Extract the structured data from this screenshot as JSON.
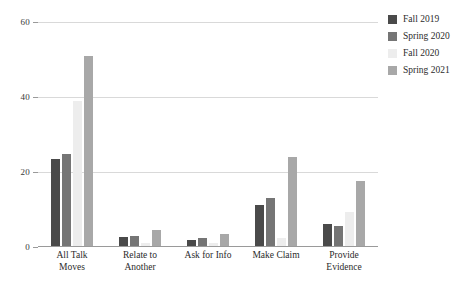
{
  "chart_data": {
    "type": "bar",
    "title": "",
    "subtitle": "",
    "xlabel": "",
    "ylabel": "",
    "ylim": [
      0,
      60
    ],
    "yticks": [
      0,
      20,
      40,
      60
    ],
    "grid": true,
    "legend_position": "right",
    "categories": [
      "All Talk Moves",
      "Relate to Another",
      "Ask for Info",
      "Make Claim",
      "Provide Evidence"
    ],
    "category_lines": [
      [
        "All Talk",
        "Moves"
      ],
      [
        "Relate to",
        "Another"
      ],
      [
        "Ask for Info",
        ""
      ],
      [
        "Make Claim",
        ""
      ],
      [
        "Provide",
        "Evidence"
      ]
    ],
    "series": [
      {
        "name": "Fall 2019",
        "color": "#4a4a4a",
        "values": [
          23.5,
          2.7,
          2.0,
          11.2,
          6.2
        ]
      },
      {
        "name": "Spring 2020",
        "color": "#757575",
        "values": [
          24.8,
          3.0,
          2.3,
          13.0,
          5.5
        ]
      },
      {
        "name": "Fall 2020",
        "color": "#ededed",
        "values": [
          39.0,
          1.0,
          1.0,
          2.5,
          9.3
        ]
      },
      {
        "name": "Spring 2021",
        "color": "#a8a8a8",
        "values": [
          51.0,
          4.5,
          3.5,
          24.0,
          17.7
        ]
      }
    ]
  },
  "axis": {
    "tick_labels": [
      "60",
      "40",
      "20",
      "0"
    ]
  },
  "legend": {
    "items": [
      {
        "label": "Fall 2019",
        "color": "#4a4a4a"
      },
      {
        "label": "Spring 2020",
        "color": "#757575"
      },
      {
        "label": "Fall 2020",
        "color": "#ededed"
      },
      {
        "label": "Spring 2021",
        "color": "#a8a8a8"
      }
    ]
  },
  "colors": {
    "gridline": "#d9d9d9",
    "axis": "#9a9a9a",
    "text": "#2b2b2b",
    "background": "#ffffff"
  }
}
